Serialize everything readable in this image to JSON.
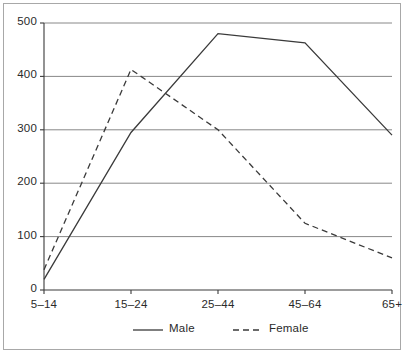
{
  "chart_data": {
    "type": "line",
    "title": "",
    "subtitle": "",
    "xlabel": "",
    "ylabel": "",
    "categories": [
      "5–14",
      "15–24",
      "25–44",
      "45–64",
      "65+"
    ],
    "series": [
      {
        "name": "Male",
        "style": "solid",
        "values": [
          20,
          295,
          480,
          463,
          290
        ]
      },
      {
        "name": "Female",
        "style": "dashed",
        "values": [
          38,
          413,
          300,
          125,
          60
        ]
      }
    ],
    "ylim": [
      0,
      500
    ],
    "yticks": [
      0,
      100,
      200,
      300,
      400,
      500
    ],
    "ytick_labels": [
      "0",
      "100",
      "200",
      "300",
      "400",
      "500"
    ],
    "grid": true,
    "grid_axis": "y",
    "legend_position": "bottom",
    "legend": [
      {
        "label": "Male",
        "style": "solid"
      },
      {
        "label": "Female",
        "style": "dashed"
      }
    ],
    "colors": {
      "line": "#3a3a3a",
      "grid": "#888888",
      "axis": "#3a3a3a",
      "text": "#2a2a2a",
      "frame": "#a8a8a8",
      "background": "#ffffff"
    }
  }
}
